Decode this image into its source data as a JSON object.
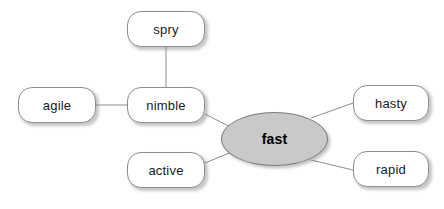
{
  "diagram": {
    "type": "word-web",
    "title_word": "fast",
    "center": {
      "id": "fast",
      "label": "fast",
      "shape": "ellipse",
      "fill_color": "#c9c9c9",
      "border_color": "#7d7d7d",
      "text_color": "#000000",
      "bold": true
    },
    "nodes": [
      {
        "id": "spry",
        "label": "spry",
        "shape": "rounded-rect",
        "fill_color": "#ffffff",
        "border_color": "#8e8e8e",
        "text_color": "#1a1a1a"
      },
      {
        "id": "agile",
        "label": "agile",
        "shape": "rounded-rect",
        "fill_color": "#ffffff",
        "border_color": "#8e8e8e",
        "text_color": "#1a1a1a"
      },
      {
        "id": "nimble",
        "label": "nimble",
        "shape": "rounded-rect",
        "fill_color": "#ffffff",
        "border_color": "#8e8e8e",
        "text_color": "#1a1a1a"
      },
      {
        "id": "active",
        "label": "active",
        "shape": "rounded-rect",
        "fill_color": "#ffffff",
        "border_color": "#8e8e8e",
        "text_color": "#1a1a1a"
      },
      {
        "id": "hasty",
        "label": "hasty",
        "shape": "rounded-rect",
        "fill_color": "#ffffff",
        "border_color": "#8e8e8e",
        "text_color": "#1a1a1a"
      },
      {
        "id": "rapid",
        "label": "rapid",
        "shape": "rounded-rect",
        "fill_color": "#ffffff",
        "border_color": "#8e8e8e",
        "text_color": "#1a1a1a"
      }
    ],
    "edges": [
      {
        "from": "spry",
        "to": "nimble"
      },
      {
        "from": "agile",
        "to": "nimble"
      },
      {
        "from": "nimble",
        "to": "fast"
      },
      {
        "from": "active",
        "to": "fast"
      },
      {
        "from": "fast",
        "to": "hasty"
      },
      {
        "from": "fast",
        "to": "rapid"
      }
    ],
    "edge_color": "#8e8e8e",
    "background_color": "#ffffff"
  }
}
